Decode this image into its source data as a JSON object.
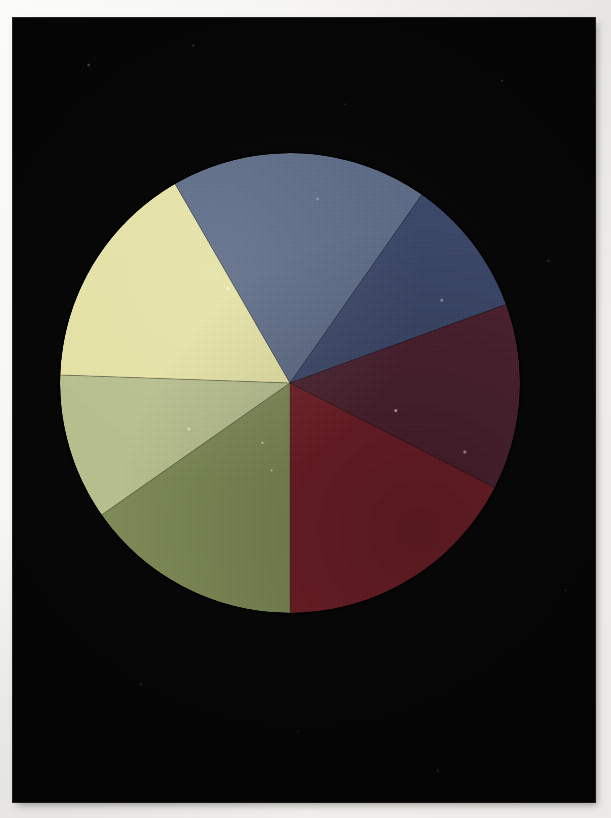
{
  "image": {
    "subject": "Colour wheel disc",
    "description": "Photograph of a circular seven-segment colour wheel on a black background",
    "background_color": "#060505",
    "mount_color": "#f4f3f1",
    "caption": ""
  },
  "photo_print": {
    "x": 13,
    "y": 18,
    "width": 582,
    "height": 784
  },
  "chart_data": {
    "type": "pie",
    "xlabel": "",
    "ylabel": "",
    "legend_position": "none",
    "grid": false,
    "center_x": 300,
    "center_y": 383,
    "radius": 230,
    "categories": [
      "Yellow",
      "Slate blue-grey",
      "Indigo blue",
      "Dark magenta",
      "Crimson red",
      "Olive green",
      "Pale green"
    ],
    "values": [
      58,
      65,
      35,
      47,
      63,
      55,
      37
    ],
    "units": "degrees",
    "colors": [
      "#e8e5a6",
      "#5b6a86",
      "#3a4668",
      "#4a1f2e",
      "#6e1d24",
      "#7d8a55",
      "#b9c18f"
    ],
    "segments": [
      {
        "name": "Yellow",
        "label": "Yellow",
        "color": "#e8e5a6",
        "start_angle": 182,
        "end_angle": 240,
        "sweep": 58,
        "position": "upper-left"
      },
      {
        "name": "Slate blue-grey",
        "label": "Slate blue-grey",
        "color": "#5b6a86",
        "start_angle": 240,
        "end_angle": 305,
        "sweep": 65,
        "position": "top"
      },
      {
        "name": "Indigo blue",
        "label": "Indigo blue",
        "color": "#3a4668",
        "start_angle": 305,
        "end_angle": 340,
        "sweep": 35,
        "position": "upper-right"
      },
      {
        "name": "Dark magenta",
        "label": "Dark magenta",
        "color": "#4a1f2e",
        "start_angle": 340,
        "end_angle": 27,
        "sweep": 47,
        "position": "right"
      },
      {
        "name": "Crimson red",
        "label": "Crimson red",
        "color": "#6e1d24",
        "start_angle": 27,
        "end_angle": 90,
        "sweep": 63,
        "position": "lower-right"
      },
      {
        "name": "Olive green",
        "label": "Olive green",
        "color": "#7d8a55",
        "start_angle": 90,
        "end_angle": 145,
        "sweep": 55,
        "position": "lower-left"
      },
      {
        "name": "Pale green",
        "label": "Pale green",
        "color": "#b9c18f",
        "start_angle": 145,
        "end_angle": 182,
        "sweep": 37,
        "position": "left"
      }
    ]
  }
}
